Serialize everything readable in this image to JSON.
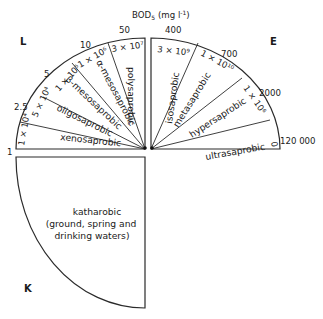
{
  "title_parts": {
    "main": "BOD",
    "sub": "5",
    "unit": "(mg l",
    "exp": "-1",
    "close": ")"
  },
  "corners": {
    "L": "L",
    "E": "E",
    "K": "K"
  },
  "left_quadrant": {
    "corner_label": "L",
    "zones": [
      {
        "name": "xenosaprobic",
        "count": "1 × 10⁴"
      },
      {
        "name": "oligosaprobic",
        "count": "5 × 10⁴"
      },
      {
        "name": "β-mesosaprobic",
        "count": "1 × 10⁵"
      },
      {
        "name": "α-mesosaprobic",
        "count": "1 × 10⁶"
      },
      {
        "name": "polysaprobic",
        "count": "3 × 10⁷"
      }
    ],
    "bod_values": [
      "1",
      "2.5",
      "5",
      "10",
      "50"
    ]
  },
  "right_quadrant": {
    "corner_label": "E",
    "zones": [
      {
        "name": "isosaprobic",
        "count": "3 × 10⁹"
      },
      {
        "name": "metasaprobic",
        "count": "1 × 10¹⁰"
      },
      {
        "name": "hypersaprobic",
        "count": "1 × 10⁶"
      },
      {
        "name": "ultrasaprobic",
        "count": "0"
      }
    ],
    "bod_values": [
      "400",
      "700",
      "2000",
      "120 000"
    ]
  },
  "bottom_quadrant": {
    "corner_label": "K",
    "zone": "katharobic",
    "description_line1": "(ground, spring and",
    "description_line2": "drinking waters)"
  }
}
